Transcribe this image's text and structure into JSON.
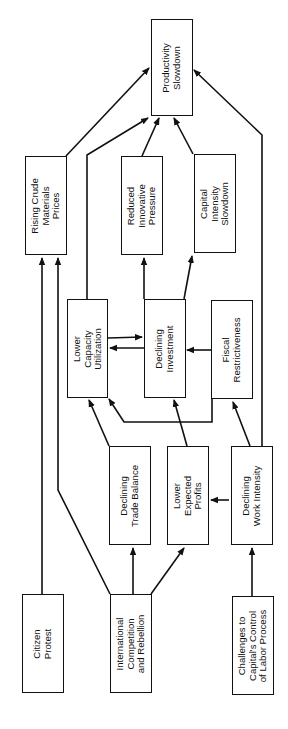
{
  "diagram": {
    "orientation": "rotated-90-ccw",
    "nodes": {
      "productivity_slowdown": {
        "label": "Productivity\nSlowdown"
      },
      "rising_crude": {
        "label": "Rising Crude\nMaterials\nPrices"
      },
      "reduced_innovative": {
        "label": "Reduced\nInnovative\nPressure"
      },
      "capital_intensity": {
        "label": "Capital\nIntensity\nSlowdown"
      },
      "lower_capacity": {
        "label": "Lower\nCapacity\nUtilization"
      },
      "declining_investment": {
        "label": "Declining\nInvestment"
      },
      "fiscal_restrictiveness": {
        "label": "Fiscal\nRestrictiveness"
      },
      "declining_trade": {
        "label": "Declining\nTrade Balance"
      },
      "lower_profits": {
        "label": "Lower\nExpected\nProfits"
      },
      "declining_work": {
        "label": "Declining\nWork Intensity"
      },
      "citizen_protest": {
        "label": "Citizen\nProtest"
      },
      "international_competition": {
        "label": "International\nCompetition\nand Rebellion"
      },
      "challenges_labor": {
        "label": "Challenges to\nCapital's Control\nof Labor Process"
      }
    },
    "edges": [
      {
        "from": "Rising Crude Materials Prices",
        "to": "Productivity Slowdown"
      },
      {
        "from": "Lower Capacity Utilization",
        "to": "Productivity Slowdown"
      },
      {
        "from": "Reduced Innovative Pressure",
        "to": "Productivity Slowdown"
      },
      {
        "from": "Capital Intensity Slowdown",
        "to": "Productivity Slowdown"
      },
      {
        "from": "Declining Work Intensity",
        "to": "Productivity Slowdown"
      },
      {
        "from": "Citizen Protest",
        "to": "Rising Crude Materials Prices"
      },
      {
        "from": "International Competition and Rebellion",
        "to": "Rising Crude Materials Prices"
      },
      {
        "from": "Declining Investment",
        "to": "Reduced Innovative Pressure"
      },
      {
        "from": "Declining Investment",
        "to": "Capital Intensity Slowdown"
      },
      {
        "from": "Lower Capacity Utilization",
        "to": "Declining Investment"
      },
      {
        "from": "Declining Investment",
        "to": "Lower Capacity Utilization"
      },
      {
        "from": "Fiscal Restrictiveness",
        "to": "Declining Investment"
      },
      {
        "from": "Fiscal Restrictiveness",
        "to": "Lower Capacity Utilization"
      },
      {
        "from": "Declining Trade Balance",
        "to": "Lower Capacity Utilization"
      },
      {
        "from": "Lower Expected Profits",
        "to": "Declining Investment"
      },
      {
        "from": "Declining Work Intensity",
        "to": "Fiscal Restrictiveness"
      },
      {
        "from": "Declining Work Intensity",
        "to": "Lower Expected Profits"
      },
      {
        "from": "International Competition and Rebellion",
        "to": "Declining Trade Balance"
      },
      {
        "from": "International Competition and Rebellion",
        "to": "Lower Expected Profits"
      },
      {
        "from": "Challenges to Capital's Control of Labor Process",
        "to": "Declining Work Intensity"
      }
    ]
  }
}
